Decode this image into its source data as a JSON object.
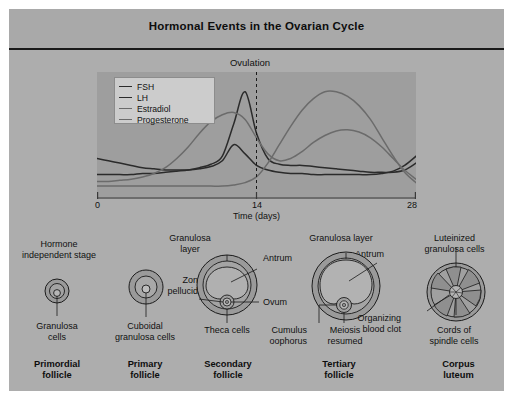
{
  "figure": {
    "title": "Hormonal Events in the Ovarian Cycle"
  },
  "chart_data": {
    "type": "line",
    "title": "Hormonal Events in the Ovarian Cycle",
    "xlabel": "Time (days)",
    "ylabel": "",
    "xlim": [
      0,
      28
    ],
    "ylim": [
      0,
      100
    ],
    "xticks": [
      "0",
      "14",
      "28"
    ],
    "grid": false,
    "legend_position": "top-left",
    "annotations": [
      {
        "label": "Ovulation",
        "x": 14,
        "type": "vertical-dashed-line"
      }
    ],
    "x": [
      0,
      1,
      2,
      3,
      4,
      5,
      6,
      7,
      8,
      9,
      10,
      11,
      12,
      13,
      14,
      15,
      16,
      17,
      18,
      19,
      20,
      21,
      22,
      23,
      24,
      25,
      26,
      27,
      28
    ],
    "series": [
      {
        "name": "FSH",
        "color": "#2b2b2b",
        "values": [
          30,
          28,
          26,
          24,
          22,
          21,
          20,
          20,
          20,
          21,
          23,
          28,
          42,
          34,
          24,
          20,
          18,
          17,
          17,
          16,
          16,
          16,
          16,
          16,
          16,
          17,
          19,
          24,
          32
        ]
      },
      {
        "name": "LH",
        "color": "#2b2b2b",
        "values": [
          16,
          16,
          16,
          16,
          17,
          17,
          18,
          19,
          20,
          22,
          25,
          32,
          60,
          88,
          52,
          30,
          25,
          24,
          24,
          23,
          22,
          21,
          20,
          19,
          18,
          18,
          18,
          20,
          26
        ]
      },
      {
        "name": "Estradiol",
        "color": "#6b6b6b",
        "values": [
          10,
          10,
          11,
          12,
          14,
          17,
          22,
          30,
          40,
          52,
          62,
          68,
          70,
          64,
          48,
          34,
          28,
          30,
          36,
          44,
          50,
          54,
          55,
          53,
          48,
          40,
          30,
          20,
          12
        ]
      },
      {
        "name": "Progesterone",
        "color": "#6b6b6b",
        "values": [
          6,
          6,
          6,
          6,
          6,
          6,
          6,
          6,
          6,
          6,
          6,
          6,
          7,
          9,
          14,
          26,
          42,
          58,
          72,
          82,
          88,
          88,
          84,
          76,
          64,
          48,
          32,
          18,
          9
        ]
      }
    ]
  },
  "stages": [
    {
      "id": "primordial",
      "name": "Primordial\nfollicle",
      "name_line1": "Primordial",
      "name_line2": "follicle",
      "captions": [
        {
          "id": "hormone-independent",
          "text": "Hormone\nindependent stage",
          "line1": "Hormone",
          "line2": "independent stage"
        },
        {
          "id": "granulosa-cells",
          "text": "Granulosa\ncells",
          "line1": "Granulosa",
          "line2": "cells"
        }
      ]
    },
    {
      "id": "primary",
      "name_line1": "Primary",
      "name_line2": "follicle",
      "captions": [
        {
          "id": "cuboidal-granulosa-cells",
          "line1": "Cuboidal",
          "line2": "granulosa cells"
        }
      ]
    },
    {
      "id": "secondary",
      "name_line1": "Secondary",
      "name_line2": "follicle",
      "captions": [
        {
          "id": "granulosa-layer",
          "line1": "Granulosa",
          "line2": "layer"
        },
        {
          "id": "zona-pellucida",
          "line1": "Zona",
          "line2": "pellucida"
        },
        {
          "id": "antrum",
          "line1": "Antrum",
          "line2": ""
        },
        {
          "id": "ovum",
          "line1": "Ovum",
          "line2": ""
        },
        {
          "id": "theca-cells",
          "line1": "Theca cells",
          "line2": ""
        }
      ]
    },
    {
      "id": "tertiary",
      "name_line1": "Tertiary",
      "name_line2": "follicle",
      "captions": [
        {
          "id": "granulosa-layer",
          "line1": "Granulosa layer",
          "line2": ""
        },
        {
          "id": "antrum",
          "line1": "Antrum",
          "line2": ""
        },
        {
          "id": "cumulus-oophorus",
          "line1": "Cumulus",
          "line2": "oophorus"
        },
        {
          "id": "meiosis-resumed",
          "line1": "Meiosis",
          "line2": "resumed"
        }
      ]
    },
    {
      "id": "corpus-luteum",
      "name_line1": "Corpus",
      "name_line2": "luteum",
      "captions": [
        {
          "id": "luteinized-granulosa-cells",
          "line1": "Luteinized",
          "line2": "granulosa cells"
        },
        {
          "id": "organizing-blood-clot",
          "line1": "Organizing",
          "line2": "blood clot"
        },
        {
          "id": "cords-of-spindle-cells",
          "line1": "Cords of",
          "line2": "spindle cells"
        }
      ]
    }
  ],
  "colors": {
    "panel_background": "#adadad",
    "title_background": "#a9a9a9",
    "plot_background": "#9e9e9e",
    "legend_background": "#cccccc",
    "ink": "#1b1b1b",
    "follicle_fill": "#9a9a9a",
    "follicle_inner": "#a8a8a8"
  }
}
